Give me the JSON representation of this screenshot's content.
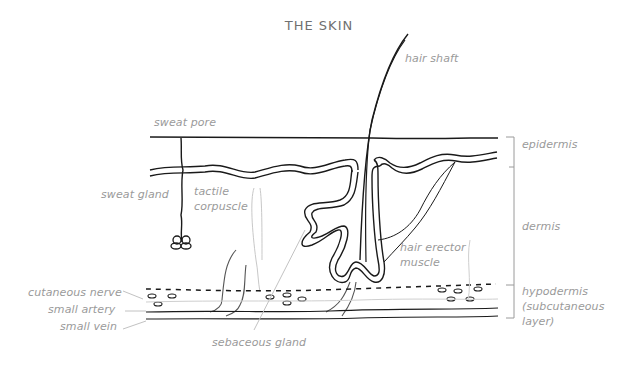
{
  "title": "THE SKIN",
  "labels": {
    "hair_shaft": "hair shaft",
    "sweat_pore": "sweat pore",
    "sweat_gland": "sweat gland",
    "tactile_corpuscle": [
      "tactile",
      "corpuscle"
    ],
    "hair_erector_muscle": [
      "hair erector",
      "muscle"
    ],
    "cutaneous_nerve": "cutaneous nerve",
    "small_artery": "small artery",
    "small_vein": "small vein",
    "sebaceous_gland": "sebaceous gland"
  },
  "layers": {
    "epidermis": "epidermis",
    "dermis": "dermis",
    "hypodermis": [
      "hypodermis",
      "(subcutaneous",
      "layer)"
    ]
  },
  "colors": {
    "ink": "#1a1a1a",
    "label": "#9a9a9a",
    "leader": "#bdbdbd",
    "background": "#ffffff"
  }
}
